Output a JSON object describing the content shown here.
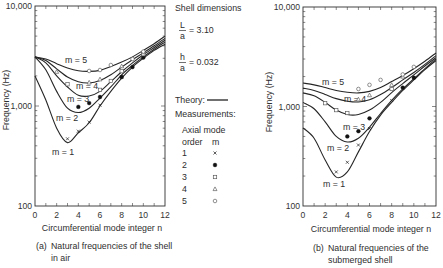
{
  "figure": {
    "captions": [
      {
        "tag": "(a)",
        "line1": "Natural frequencies of the shell",
        "line2": "in air"
      },
      {
        "tag": "(b)",
        "line1": "Natural frequencies of the",
        "line2": "submerged shell"
      }
    ]
  },
  "legend": {
    "title": "Shell dimensions",
    "ratios": [
      {
        "num": "L",
        "den": "a",
        "value": "= 3.10"
      },
      {
        "num": "h",
        "den": "a",
        "value": "= 0.032"
      }
    ],
    "theory_label": "Theory:",
    "measurements_label": "Measurements:",
    "header_line1": "Axial mode",
    "header_order": "order",
    "header_m": "m",
    "rows": [
      {
        "order": "1",
        "marker": "cross"
      },
      {
        "order": "2",
        "marker": "filled-circle"
      },
      {
        "order": "3",
        "marker": "square"
      },
      {
        "order": "4",
        "marker": "triangle"
      },
      {
        "order": "5",
        "marker": "circle"
      }
    ]
  },
  "chart_data": [
    {
      "type": "line",
      "title": "(a) Natural frequencies of the shell in air",
      "xlabel": "Circumferential mode integer n",
      "ylabel": "Frequency (Hz)",
      "xscale": "linear",
      "yscale": "log",
      "xlim": [
        0,
        12
      ],
      "ylim": [
        100,
        10000
      ],
      "grid": false,
      "x_ticks": [
        0,
        2,
        4,
        6,
        8,
        10,
        12
      ],
      "x_tick_labels": [
        "0",
        "2",
        "4",
        "6",
        "8",
        "10",
        "12"
      ],
      "y_ticks": [
        100,
        1000,
        10000
      ],
      "y_tick_labels": [
        "100",
        "1,000",
        "10,000"
      ],
      "x": [
        0,
        1,
        2,
        3,
        4,
        5,
        6,
        7,
        8,
        9,
        10,
        11,
        12
      ],
      "series": [
        {
          "name": "m = 1 (theory)",
          "label": "m = 1",
          "values": [
            2000,
            1150,
            600,
            430,
            540,
            680,
            1000,
            1400,
            1900,
            2450,
            3000,
            3600,
            4150
          ]
        },
        {
          "name": "m = 2 (theory)",
          "label": "m = 2",
          "values": [
            3100,
            2300,
            1400,
            950,
            860,
            950,
            1200,
            1550,
            2050,
            2550,
            3100,
            3700,
            4350
          ]
        },
        {
          "name": "m = 3 (theory)",
          "label": "m = 3",
          "values": [
            3100,
            2700,
            2000,
            1550,
            1280,
            1260,
            1400,
            1750,
            2200,
            2700,
            3250,
            3850,
            4550
          ]
        },
        {
          "name": "m = 4 (theory)",
          "label": "m = 4",
          "values": [
            3100,
            2850,
            2350,
            1950,
            1750,
            1700,
            1800,
            2050,
            2450,
            2900,
            3400,
            4000,
            4750
          ]
        },
        {
          "name": "m = 5 (theory)",
          "label": "m = 5",
          "values": [
            3100,
            2950,
            2650,
            2400,
            2250,
            2220,
            2270,
            2480,
            2750,
            3100,
            3600,
            4200,
            5000
          ]
        }
      ],
      "measurements": [
        {
          "m": 1,
          "marker": "cross",
          "points": [
            [
              3,
              470
            ],
            [
              4,
              560
            ],
            [
              5,
              690
            ],
            [
              6,
              1020
            ],
            [
              8,
              1950
            ]
          ]
        },
        {
          "m": 2,
          "marker": "filled-circle",
          "points": [
            [
              4,
              980
            ],
            [
              5,
              1070
            ],
            [
              6,
              1230
            ],
            [
              8,
              1950
            ],
            [
              9,
              2450
            ],
            [
              10,
              3050
            ]
          ]
        },
        {
          "m": 3,
          "marker": "square",
          "points": [
            [
              3,
              1650
            ],
            [
              6,
              1450
            ],
            [
              7,
              1780
            ],
            [
              8,
              2230
            ],
            [
              10,
              3300
            ]
          ]
        },
        {
          "m": 4,
          "marker": "triangle",
          "points": [
            [
              2,
              2200
            ],
            [
              5,
              1720
            ],
            [
              6,
              1850
            ],
            [
              8,
              2500
            ],
            [
              10,
              3450
            ]
          ]
        },
        {
          "m": 5,
          "marker": "circle",
          "points": [
            [
              5,
              2240
            ],
            [
              6,
              2290
            ],
            [
              7,
              2570
            ],
            [
              9,
              2950
            ],
            [
              10,
              3500
            ]
          ]
        }
      ]
    },
    {
      "type": "line",
      "title": "(b) Natural frequencies of the submerged shell",
      "xlabel": "Circumferential mode integer n",
      "ylabel": "Frequency (Hz)",
      "xscale": "linear",
      "yscale": "log",
      "xlim": [
        0,
        12
      ],
      "ylim": [
        100,
        10000
      ],
      "grid": false,
      "x_ticks": [
        0,
        2,
        4,
        6,
        8,
        10,
        12
      ],
      "x_tick_labels": [
        "0",
        "2",
        "4",
        "6",
        "8",
        "10",
        "12"
      ],
      "y_ticks": [
        100,
        1000,
        10000
      ],
      "y_tick_labels": [
        "100",
        "1,000",
        "10,000"
      ],
      "x": [
        0,
        1,
        2,
        3,
        4,
        5,
        6,
        7,
        8,
        9,
        10,
        11,
        12
      ],
      "series": [
        {
          "name": "m = 1 (theory)",
          "label": "m = 1",
          "values": [
            610,
            480,
            290,
            195,
            220,
            350,
            560,
            820,
            1100,
            1450,
            1850,
            2350,
            2900
          ]
        },
        {
          "name": "m = 2 (theory)",
          "label": "m = 2",
          "values": [
            1100,
            950,
            700,
            500,
            440,
            480,
            620,
            850,
            1150,
            1500,
            1900,
            2400,
            3000
          ]
        },
        {
          "name": "m = 3 (theory)",
          "label": "m = 3",
          "values": [
            1370,
            1280,
            1100,
            920,
            830,
            830,
            920,
            1100,
            1380,
            1700,
            2080,
            2550,
            3100
          ]
        },
        {
          "name": "m = 4 (theory)",
          "label": "m = 4",
          "values": [
            1530,
            1450,
            1320,
            1200,
            1130,
            1110,
            1170,
            1320,
            1550,
            1850,
            2200,
            2650,
            3250
          ]
        },
        {
          "name": "m = 5 (theory)",
          "label": "m = 5",
          "values": [
            1720,
            1650,
            1550,
            1450,
            1390,
            1370,
            1420,
            1550,
            1780,
            2050,
            2400,
            2850,
            3450
          ]
        }
      ],
      "measurements": [
        {
          "m": 1,
          "marker": "cross",
          "points": [
            [
              3,
              220
            ],
            [
              4,
              275
            ],
            [
              5,
              410
            ],
            [
              6,
              600
            ],
            [
              8,
              1150
            ]
          ]
        },
        {
          "m": 2,
          "marker": "filled-circle",
          "points": [
            [
              4,
              500
            ],
            [
              5,
              565
            ],
            [
              6,
              760
            ],
            [
              9,
              1550
            ],
            [
              10,
              1950
            ]
          ]
        },
        {
          "m": 3,
          "marker": "square",
          "points": [
            [
              2,
              1080
            ],
            [
              3,
              920
            ],
            [
              4,
              860
            ],
            [
              8,
              1500
            ]
          ]
        },
        {
          "m": 4,
          "marker": "triangle",
          "points": [
            [
              5,
              1180
            ],
            [
              6,
              1300
            ],
            [
              8,
              1650
            ],
            [
              9,
              2000
            ]
          ]
        },
        {
          "m": 5,
          "marker": "circle",
          "points": [
            [
              5,
              1500
            ],
            [
              6,
              1650
            ],
            [
              7,
              1850
            ],
            [
              9,
              2100
            ],
            [
              10,
              2500
            ]
          ]
        }
      ]
    }
  ]
}
